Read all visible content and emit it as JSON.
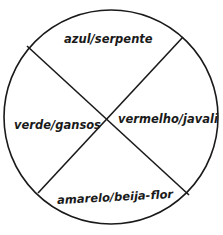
{
  "diagram": {
    "type": "circle divided into four sectors",
    "sectors": [
      {
        "position": "top",
        "label": "azul/serpente"
      },
      {
        "position": "left",
        "label": "verde/gansos"
      },
      {
        "position": "right",
        "label": "vermelho/javali"
      },
      {
        "position": "bottom",
        "label": "amarelo/beija-flor"
      }
    ],
    "colors": {
      "stroke": "#1a1a1a",
      "background": "#ffffff"
    }
  }
}
